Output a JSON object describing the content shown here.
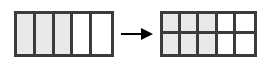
{
  "figure": {
    "colors": {
      "shade_fill": "#e9e9e9",
      "unshaded_fill": "#ffffff",
      "stroke": "#3b3b3b",
      "arrow": "#000000",
      "background": "#ffffff"
    },
    "left": {
      "name": "five-strip-bar",
      "rows": 1,
      "columns": 5,
      "total_parts": 5,
      "shaded_parts": 3,
      "fraction_label": "3/5",
      "cells": [
        {
          "index": 1,
          "shaded": true
        },
        {
          "index": 2,
          "shaded": true
        },
        {
          "index": 3,
          "shaded": true
        },
        {
          "index": 4,
          "shaded": false
        },
        {
          "index": 5,
          "shaded": false
        }
      ]
    },
    "arrow": {
      "name": "right-arrow",
      "direction": "right",
      "glyph": "arrow-right-icon"
    },
    "right": {
      "name": "two-by-five-grid",
      "rows": 2,
      "columns": 5,
      "total_parts": 10,
      "shaded_parts": 6,
      "fraction_label": "6/10",
      "cells": [
        {
          "index": 1,
          "shaded": true
        },
        {
          "index": 2,
          "shaded": true
        },
        {
          "index": 3,
          "shaded": true
        },
        {
          "index": 4,
          "shaded": false
        },
        {
          "index": 5,
          "shaded": false
        },
        {
          "index": 6,
          "shaded": true
        },
        {
          "index": 7,
          "shaded": true
        },
        {
          "index": 8,
          "shaded": true
        },
        {
          "index": 9,
          "shaded": false
        },
        {
          "index": 10,
          "shaded": false
        }
      ]
    }
  }
}
